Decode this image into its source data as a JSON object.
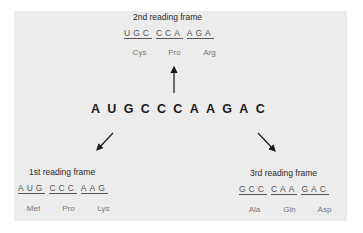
{
  "sequence": "AUGCCCAAGAC",
  "frames": {
    "second": {
      "title": "2nd reading frame",
      "codons": [
        "UGC",
        "CCA",
        "AGA"
      ],
      "amino_acids": [
        "Cys",
        "Pro",
        "Arg"
      ]
    },
    "first": {
      "title": "1st reading frame",
      "codons": [
        "AUG",
        "CCC",
        "AAG"
      ],
      "amino_acids": [
        "Met",
        "Pro",
        "Lys"
      ]
    },
    "third": {
      "title": "3rd reading frame",
      "codons": [
        "GCC",
        "CAA",
        "GAC"
      ],
      "amino_acids": [
        "Ala",
        "Gln",
        "Asp"
      ]
    }
  },
  "colors": {
    "panel": "#ececec",
    "sequence": "#1a1a1a",
    "codon_text": "#555555",
    "amino_acid_text": "#777777"
  }
}
